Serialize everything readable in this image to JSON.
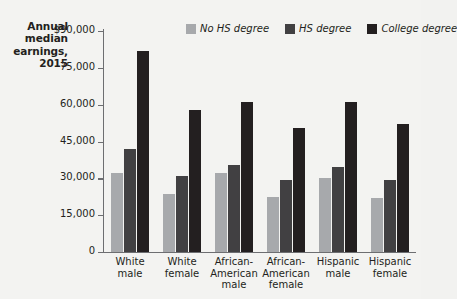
{
  "chart_data": {
    "type": "bar",
    "title": "Annual median earnings, 2015",
    "title_lines": [
      "Annual",
      "median",
      "earnings,",
      "2015"
    ],
    "xlabel": "",
    "ylabel": "Annual median earnings, 2015",
    "ylim": [
      0,
      90000
    ],
    "grid": false,
    "legend_position": "top",
    "y_ticks": [
      {
        "value": 90000,
        "label": "$90,000"
      },
      {
        "value": 75000,
        "label": "75,000"
      },
      {
        "value": 60000,
        "label": "60,000"
      },
      {
        "value": 45000,
        "label": "45,000"
      },
      {
        "value": 30000,
        "label": "30,000"
      },
      {
        "value": 15000,
        "label": "15,000"
      },
      {
        "value": 0,
        "label": "0"
      }
    ],
    "categories": [
      "White male",
      "White female",
      "African-American male",
      "African-American female",
      "Hispanic male",
      "Hispanic female"
    ],
    "category_lines": [
      [
        "White",
        "male"
      ],
      [
        "White",
        "female"
      ],
      [
        "African-",
        "American",
        "male"
      ],
      [
        "African-",
        "American",
        "female"
      ],
      [
        "Hispanic",
        "male"
      ],
      [
        "Hispanic",
        "female"
      ]
    ],
    "series": [
      {
        "name": "No HS degree",
        "color": "#a7a9ac",
        "values": [
          32000,
          23500,
          32000,
          22500,
          30000,
          22000
        ]
      },
      {
        "name": "HS degree",
        "color": "#414042",
        "values": [
          42000,
          31000,
          35500,
          29500,
          34500,
          29500
        ]
      },
      {
        "name": "College degree",
        "color": "#231f20",
        "values": [
          82000,
          58000,
          61000,
          50500,
          61000,
          52000
        ]
      }
    ]
  },
  "colors": {
    "background": "#f3f3f1",
    "axis": "#6d6e71",
    "text": "#231f20",
    "no_hs_degree": "#a7a9ac",
    "hs_degree": "#414042",
    "college_degree": "#231f20"
  }
}
